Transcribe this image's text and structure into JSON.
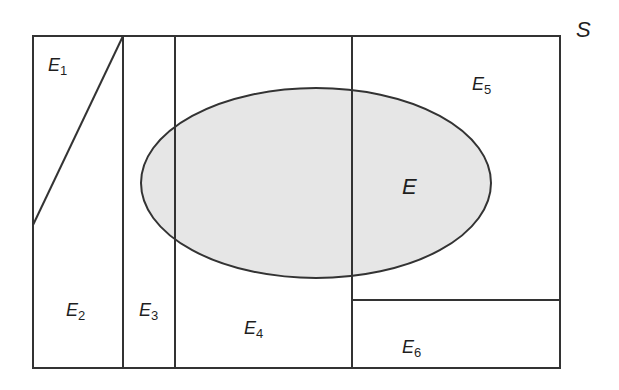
{
  "diagram": {
    "type": "venn-partition",
    "sample_space_label": "S",
    "event_label": "E",
    "partition": [
      {
        "id": "E1",
        "base": "E",
        "sub": "1"
      },
      {
        "id": "E2",
        "base": "E",
        "sub": "2"
      },
      {
        "id": "E3",
        "base": "E",
        "sub": "3"
      },
      {
        "id": "E4",
        "base": "E",
        "sub": "4"
      },
      {
        "id": "E5",
        "base": "E",
        "sub": "5"
      },
      {
        "id": "E6",
        "base": "E",
        "sub": "6"
      }
    ],
    "colors": {
      "stroke": "#333333",
      "event_fill": "#e6e6e6",
      "background": "#ffffff",
      "text": "#1f1f1f"
    }
  }
}
